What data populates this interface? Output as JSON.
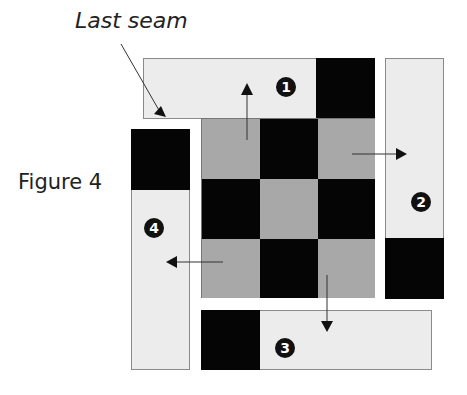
{
  "labels": {
    "last_seam": "Last seam",
    "figure": "Figure 4"
  },
  "strips": [
    {
      "id": 1,
      "badge": "1",
      "direction": "up"
    },
    {
      "id": 2,
      "badge": "2",
      "direction": "right"
    },
    {
      "id": 3,
      "badge": "3",
      "direction": "down"
    },
    {
      "id": 4,
      "badge": "4",
      "direction": "left"
    }
  ],
  "center_block": {
    "rows": 3,
    "cols": 3,
    "pattern": [
      [
        "gray",
        "black",
        "gray"
      ],
      [
        "black",
        "gray",
        "black"
      ],
      [
        "gray",
        "black",
        "gray"
      ]
    ]
  },
  "colors": {
    "black": "#050505",
    "gray": "#a8a8a8",
    "light": "#ececec"
  }
}
